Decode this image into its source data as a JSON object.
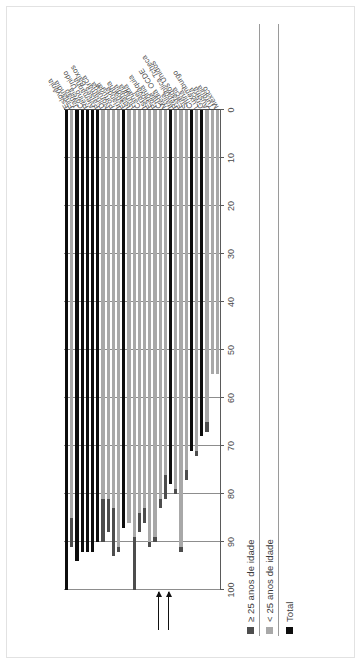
{
  "chart_data": {
    "type": "bar",
    "orientation": "horizontal",
    "stacked": true,
    "title": "",
    "xlabel": "",
    "ylabel": "",
    "xlim": [
      0,
      100
    ],
    "xticks": [
      0,
      10,
      20,
      30,
      40,
      50,
      60,
      70,
      80,
      90,
      100
    ],
    "grid": true,
    "legend_position": "top-left",
    "legend": [
      {
        "key": "old",
        "label": "≥ 25 anos de idade",
        "color": "#4d4d4d"
      },
      {
        "key": "young",
        "label": "< 25 anos de idade",
        "color": "#a8a8a8"
      },
      {
        "key": "total",
        "label": "Total",
        "color": "#0d0d0d"
      }
    ],
    "categories": [
      "Eslovênia",
      "Finlândia",
      "Japão",
      "Coreia",
      "Reino Unido",
      "Alemanha",
      "Países Baixos",
      "Dinamarca",
      "Noruega",
      "Portugal",
      "Irlanda",
      "Espanha",
      "Islândia",
      "Hungria",
      "Canadá",
      "Israel",
      "Eslováquia",
      "Polônia",
      "Chile",
      "Média OCDE",
      "Itália",
      "República Tcheca",
      "Estados Unidos",
      "Suécia",
      "China",
      "Luxemburgo",
      "Grécia",
      "Áustria",
      "Turquia",
      "México"
    ],
    "series": [
      {
        "name": "Total",
        "key": "total",
        "color": "#0d0d0d",
        "values": [
          100,
          null,
          94,
          92,
          92,
          92,
          90,
          null,
          null,
          null,
          null,
          87,
          null,
          null,
          null,
          null,
          null,
          null,
          null,
          null,
          78,
          null,
          null,
          null,
          71,
          null,
          68,
          null,
          null,
          null
        ]
      },
      {
        "name": "< 25 anos de idade",
        "key": "young",
        "color": "#a8a8a8",
        "values": [
          null,
          85,
          null,
          null,
          null,
          null,
          null,
          81,
          81,
          83,
          91,
          null,
          86,
          89,
          84,
          83,
          90,
          89,
          81,
          76,
          null,
          79,
          91,
          75,
          null,
          71,
          null,
          65,
          55,
          55
        ]
      },
      {
        "name": "≥ 25 anos de idade",
        "key": "old",
        "color": "#4d4d4d",
        "values": [
          null,
          91,
          null,
          null,
          null,
          null,
          null,
          90,
          88,
          93,
          92,
          null,
          86,
          100,
          88,
          86,
          91,
          90,
          83,
          81,
          null,
          80,
          92,
          77,
          null,
          72,
          null,
          67,
          null,
          null
        ]
      }
    ],
    "annotations": [
      {
        "name": "arrow-italia",
        "category": "Itália",
        "label": ""
      },
      {
        "name": "arrow-estados-unidos",
        "category": "Estados Unidos",
        "label": ""
      }
    ]
  }
}
